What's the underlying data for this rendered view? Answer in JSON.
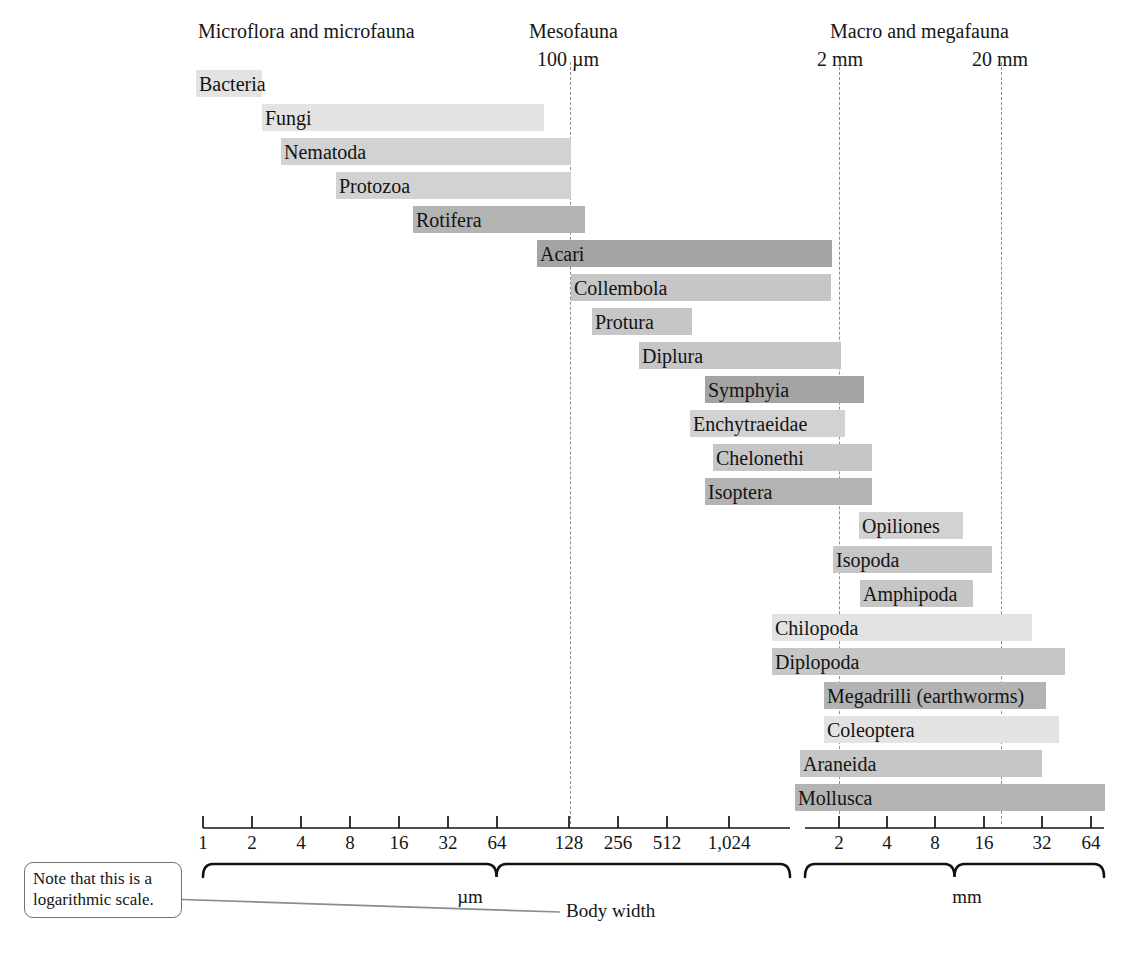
{
  "groups": [
    {
      "name": "microflora-microfauna",
      "label": "Microflora and microfauna",
      "x": 316,
      "sub": null,
      "sub_x": null
    },
    {
      "name": "mesofauna",
      "label": "Mesofauna",
      "x": 578,
      "sub": "100 µm",
      "sub_x": 570
    },
    {
      "name": "macro-megafauna",
      "label": "Macro and megafauna",
      "x": 920,
      "sub": null,
      "sub_x": null
    }
  ],
  "boundary_labels": [
    {
      "label": "100 µm",
      "x": 570
    },
    {
      "label": "2 mm",
      "x": 841
    },
    {
      "label": "20 mm",
      "x": 1003
    }
  ],
  "boundary_lines": [
    {
      "name": "line-100um",
      "x": 570
    },
    {
      "name": "line-2mm",
      "x": 839
    },
    {
      "name": "line-20mm",
      "x": 1001
    }
  ],
  "axis": {
    "um_ticks": [
      "1",
      "2",
      "4",
      "8",
      "16",
      "32",
      "64",
      "128",
      "256",
      "512",
      "1,024"
    ],
    "um_tick_x": [
      203,
      252,
      301,
      350,
      399,
      448,
      497,
      569,
      618,
      667,
      729
    ],
    "mm_ticks": [
      "2",
      "4",
      "8",
      "16",
      "32",
      "64"
    ],
    "mm_tick_x": [
      839,
      887,
      935,
      984,
      1042,
      1091
    ],
    "um_unit": "µm",
    "mm_unit": "mm",
    "um_unit_x": 470,
    "mm_unit_x": 967,
    "um_brace_left": 203,
    "um_brace_right": 790,
    "mm_brace_left": 805,
    "mm_brace_right": 1104
  },
  "note": {
    "text": "Note that this is a logarithmic scale.",
    "leader_from_x": 166,
    "leader_from_y": 899,
    "leader_to_x": 560,
    "leader_to_y": 912
  },
  "body_width_label": "Body width",
  "colors": {
    "light": "#e3e3e3",
    "medium_light": "#d2d2d2",
    "medium": "#c6c6c6",
    "medium_dark": "#b3b3b3",
    "dark": "#a4a4a4"
  },
  "chart_data": {
    "type": "bar",
    "title": "",
    "xlabel": "Body width",
    "ylabel": "",
    "orientation": "horizontal",
    "scale": "logarithmic",
    "axis_segments": [
      {
        "unit": "µm",
        "ticks": [
          1,
          2,
          4,
          8,
          16,
          32,
          64,
          128,
          256,
          512,
          1024
        ]
      },
      {
        "unit": "mm",
        "ticks": [
          2,
          4,
          8,
          16,
          32,
          64
        ]
      }
    ],
    "annotations": [
      {
        "text": "Microflora and microfauna",
        "type": "group-header"
      },
      {
        "text": "Mesofauna",
        "type": "group-header"
      },
      {
        "text": "Macro and megafauna",
        "type": "group-header"
      },
      {
        "text": "100 µm",
        "type": "boundary"
      },
      {
        "text": "2 mm",
        "type": "boundary"
      },
      {
        "text": "20 mm",
        "type": "boundary"
      },
      {
        "text": "Note that this is a logarithmic scale.",
        "type": "callout"
      }
    ],
    "categories": [
      "Bacteria",
      "Fungi",
      "Nematoda",
      "Protozoa",
      "Rotifera",
      "Acari",
      "Collembola",
      "Protura",
      "Diplura",
      "Symphyia",
      "Enchytraeidae",
      "Chelonethi",
      "Isoptera",
      "Opiliones",
      "Isopoda",
      "Amphipoda",
      "Chilopoda",
      "Diplopoda",
      "Megadrilli (earthworms)",
      "Coleoptera",
      "Araneida",
      "Mollusca"
    ],
    "bars": [
      {
        "label": "Bacteria",
        "x": 196,
        "w": 66,
        "y": 70,
        "color": "#e3e3e3",
        "label_inside": true
      },
      {
        "label": "Fungi",
        "x": 262,
        "w": 282,
        "y": 104,
        "color": "#e3e3e3",
        "label_inside": true
      },
      {
        "label": "Nematoda",
        "x": 281,
        "w": 290,
        "y": 138,
        "color": "#d2d2d2",
        "label_inside": true
      },
      {
        "label": "Protozoa",
        "x": 336,
        "w": 235,
        "y": 172,
        "color": "#d2d2d2",
        "label_inside": true
      },
      {
        "label": "Rotifera",
        "x": 413,
        "w": 172,
        "y": 206,
        "color": "#b3b3b3",
        "label_inside": true
      },
      {
        "label": "Acari",
        "x": 537,
        "w": 295,
        "y": 240,
        "color": "#a4a4a4",
        "label_inside": true
      },
      {
        "label": "Collembola",
        "x": 571,
        "w": 260,
        "y": 274,
        "color": "#c6c6c6",
        "label_inside": true
      },
      {
        "label": "Protura",
        "x": 592,
        "w": 100,
        "y": 308,
        "color": "#c6c6c6",
        "label_inside": true
      },
      {
        "label": "Diplura",
        "x": 639,
        "w": 202,
        "y": 342,
        "color": "#c6c6c6",
        "label_inside": true
      },
      {
        "label": "Symphyia",
        "x": 705,
        "w": 159,
        "y": 376,
        "color": "#a4a4a4",
        "label_inside": true
      },
      {
        "label": "Enchytraeidae",
        "x": 690,
        "w": 155,
        "y": 410,
        "color": "#d2d2d2",
        "label_inside": true
      },
      {
        "label": "Chelonethi",
        "x": 713,
        "w": 159,
        "y": 444,
        "color": "#c6c6c6",
        "label_inside": true
      },
      {
        "label": "Isoptera",
        "x": 705,
        "w": 167,
        "y": 478,
        "color": "#b3b3b3",
        "label_inside": true
      },
      {
        "label": "Opiliones",
        "x": 859,
        "w": 104,
        "y": 512,
        "color": "#d2d2d2",
        "label_inside": true
      },
      {
        "label": "Isopoda",
        "x": 833,
        "w": 159,
        "y": 546,
        "color": "#c6c6c6",
        "label_inside": true
      },
      {
        "label": "Amphipoda",
        "x": 860,
        "w": 113,
        "y": 580,
        "color": "#c6c6c6",
        "label_inside": true
      },
      {
        "label": "Chilopoda",
        "x": 772,
        "w": 260,
        "y": 614,
        "color": "#e3e3e3",
        "label_inside": true
      },
      {
        "label": "Diplopoda",
        "x": 772,
        "w": 293,
        "y": 648,
        "color": "#c6c6c6",
        "label_inside": true
      },
      {
        "label": "Megadrilli (earthworms)",
        "x": 824,
        "w": 222,
        "y": 682,
        "color": "#b3b3b3",
        "label_inside": true
      },
      {
        "label": "Coleoptera",
        "x": 824,
        "w": 235,
        "y": 716,
        "color": "#e3e3e3",
        "label_inside": true
      },
      {
        "label": "Araneida",
        "x": 800,
        "w": 242,
        "y": 750,
        "color": "#c6c6c6",
        "label_inside": true
      },
      {
        "label": "Mollusca",
        "x": 795,
        "w": 310,
        "y": 784,
        "color": "#b3b3b3",
        "label_inside": true
      }
    ]
  }
}
